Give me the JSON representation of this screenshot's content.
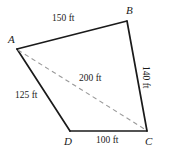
{
  "figure": {
    "name": "quadrilateral-abcd-with-diagonal",
    "shape_type": "quadrilateral",
    "background_color": "#ffffff",
    "solid_stroke_color": "#1a1a1a",
    "dashed_stroke_color": "#9a9a9a",
    "vertices": [
      {
        "id": "A",
        "label": "A",
        "x": 17,
        "y": 49,
        "label_x": 8,
        "label_y": 36
      },
      {
        "id": "B",
        "label": "B",
        "x": 127,
        "y": 21,
        "label_x": 126,
        "label_y": 6
      },
      {
        "id": "C",
        "label": "C",
        "x": 147,
        "y": 131,
        "label_x": 145,
        "label_y": 136
      },
      {
        "id": "D",
        "label": "D",
        "x": 70,
        "y": 131,
        "label_x": 64,
        "label_y": 136
      }
    ],
    "edges": [
      {
        "id": "AB",
        "from": "A",
        "to": "B",
        "style": "solid",
        "length_label": "150 ft"
      },
      {
        "id": "BC",
        "from": "B",
        "to": "C",
        "style": "solid",
        "length_label": "140 ft"
      },
      {
        "id": "CD",
        "from": "C",
        "to": "D",
        "style": "solid",
        "length_label": "100 ft"
      },
      {
        "id": "DA",
        "from": "D",
        "to": "A",
        "style": "solid",
        "length_label": "125 ft"
      },
      {
        "id": "AC",
        "from": "A",
        "to": "C",
        "style": "dashed",
        "length_label": "200 ft"
      }
    ],
    "measurement_labels": {
      "top_side": "150 ft",
      "right_side": "140 ft",
      "bottom_side": "100 ft",
      "left_side": "125 ft",
      "diagonal": "200 ft"
    },
    "unit": "ft"
  }
}
